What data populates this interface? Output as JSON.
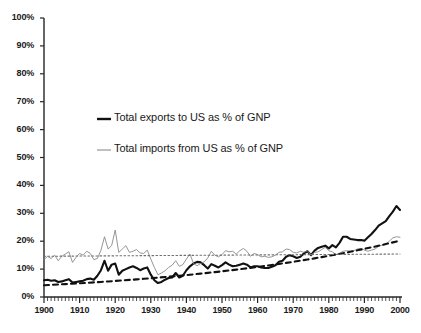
{
  "chart_data": {
    "type": "line",
    "title": "",
    "xlabel": "",
    "ylabel": "",
    "xlim": [
      1900,
      2000
    ],
    "ylim": [
      0,
      100
    ],
    "grid": false,
    "legend_position": "inside-upper-left",
    "y_ticks": [
      "0%",
      "10%",
      "20%",
      "30%",
      "40%",
      "50%",
      "60%",
      "70%",
      "80%",
      "90%",
      "100%"
    ],
    "y_tick_values": [
      0,
      10,
      20,
      30,
      40,
      50,
      60,
      70,
      80,
      90,
      100
    ],
    "x_ticks": [
      "1900",
      "1910",
      "1920",
      "1930",
      "1940",
      "1950",
      "1960",
      "1970",
      "1980",
      "1990",
      "2000"
    ],
    "x_tick_values": [
      1900,
      1910,
      1920,
      1930,
      1940,
      1950,
      1960,
      1970,
      1980,
      1990,
      2000
    ],
    "x_minor_tick_interval": 1,
    "series": [
      {
        "name": "Total exports to US as % of GNP",
        "style": "thick-solid",
        "color": "#111111",
        "x": [
          1900,
          1901,
          1902,
          1903,
          1904,
          1905,
          1906,
          1907,
          1908,
          1909,
          1910,
          1911,
          1912,
          1913,
          1914,
          1915,
          1916,
          1917,
          1918,
          1919,
          1920,
          1921,
          1922,
          1923,
          1924,
          1925,
          1926,
          1927,
          1928,
          1929,
          1930,
          1931,
          1932,
          1933,
          1934,
          1935,
          1936,
          1937,
          1938,
          1939,
          1940,
          1941,
          1942,
          1943,
          1944,
          1945,
          1946,
          1947,
          1948,
          1949,
          1950,
          1951,
          1952,
          1953,
          1954,
          1955,
          1956,
          1957,
          1958,
          1959,
          1960,
          1961,
          1962,
          1963,
          1964,
          1965,
          1966,
          1967,
          1968,
          1969,
          1970,
          1971,
          1972,
          1973,
          1974,
          1975,
          1976,
          1977,
          1978,
          1979,
          1980,
          1981,
          1982,
          1983,
          1984,
          1985,
          1986,
          1987,
          1988,
          1989,
          1990,
          1991,
          1992,
          1993,
          1994,
          1995,
          1996,
          1997,
          1998,
          1999,
          2000
        ],
        "values": [
          6.0,
          6.2,
          5.8,
          6.0,
          5.4,
          5.6,
          6.0,
          6.4,
          5.2,
          5.4,
          5.6,
          5.8,
          6.4,
          6.6,
          6.2,
          7.6,
          9.6,
          13.0,
          9.4,
          11.6,
          12.0,
          8.0,
          9.4,
          10.0,
          10.6,
          11.0,
          10.4,
          9.6,
          10.2,
          10.6,
          8.0,
          6.0,
          5.0,
          5.4,
          6.2,
          6.8,
          7.0,
          8.6,
          7.0,
          7.6,
          9.6,
          11.0,
          12.0,
          12.6,
          12.4,
          11.4,
          10.2,
          11.8,
          11.2,
          10.6,
          11.4,
          12.4,
          11.6,
          11.0,
          11.2,
          11.6,
          12.0,
          11.6,
          10.6,
          11.0,
          11.0,
          10.6,
          10.4,
          10.4,
          10.8,
          11.4,
          12.6,
          13.0,
          14.4,
          15.0,
          14.6,
          14.0,
          14.4,
          15.6,
          16.4,
          15.0,
          16.6,
          17.6,
          18.0,
          18.4,
          17.4,
          18.6,
          17.8,
          19.4,
          21.6,
          21.6,
          20.8,
          20.6,
          20.4,
          20.4,
          20.2,
          21.4,
          22.6,
          24.0,
          25.6,
          26.4,
          27.2,
          29.0,
          30.6,
          32.6,
          31.2
        ]
      },
      {
        "name": "Total imports from US as % of GNP",
        "style": "thin-solid",
        "color": "#8a8a8a",
        "x": [
          1900,
          1901,
          1902,
          1903,
          1904,
          1905,
          1906,
          1907,
          1908,
          1909,
          1910,
          1911,
          1912,
          1913,
          1914,
          1915,
          1916,
          1917,
          1918,
          1919,
          1920,
          1921,
          1922,
          1923,
          1924,
          1925,
          1926,
          1927,
          1928,
          1929,
          1930,
          1931,
          1932,
          1933,
          1934,
          1935,
          1936,
          1937,
          1938,
          1939,
          1940,
          1941,
          1942,
          1943,
          1944,
          1945,
          1946,
          1947,
          1948,
          1949,
          1950,
          1951,
          1952,
          1953,
          1954,
          1955,
          1956,
          1957,
          1958,
          1959,
          1960,
          1961,
          1962,
          1963,
          1964,
          1965,
          1966,
          1967,
          1968,
          1969,
          1970,
          1971,
          1972,
          1973,
          1974,
          1975,
          1976,
          1977,
          1978,
          1979,
          1980,
          1981,
          1982,
          1983,
          1984,
          1985,
          1986,
          1987,
          1988,
          1989,
          1990,
          1991,
          1992,
          1993,
          1994,
          1995,
          1996,
          1997,
          1998,
          1999,
          2000
        ],
        "values": [
          13.4,
          14.6,
          13.8,
          15.0,
          13.0,
          14.6,
          15.4,
          16.2,
          12.4,
          14.2,
          15.6,
          15.0,
          16.4,
          15.6,
          13.4,
          13.8,
          16.8,
          21.6,
          17.2,
          18.4,
          24.0,
          16.0,
          17.2,
          18.4,
          16.0,
          16.4,
          17.0,
          15.8,
          15.6,
          16.8,
          13.6,
          10.6,
          8.0,
          8.6,
          9.4,
          10.6,
          11.4,
          13.0,
          11.0,
          11.6,
          13.6,
          15.4,
          12.0,
          11.2,
          12.0,
          12.6,
          14.0,
          16.4,
          15.0,
          14.4,
          15.2,
          16.6,
          16.2,
          16.4,
          15.4,
          16.6,
          17.4,
          16.4,
          14.6,
          15.6,
          15.2,
          14.4,
          14.6,
          14.2,
          14.4,
          15.0,
          16.0,
          16.2,
          17.2,
          17.0,
          16.0,
          15.8,
          16.4,
          16.0,
          16.6,
          15.0,
          16.0,
          16.2,
          17.0,
          17.8,
          16.6,
          16.2,
          15.2,
          15.6,
          16.4,
          16.6,
          16.4,
          16.6,
          17.2,
          17.4,
          16.8,
          16.4,
          16.8,
          17.2,
          18.2,
          18.6,
          18.8,
          20.0,
          21.2,
          21.6,
          21.4
        ]
      },
      {
        "name": "exports-trend",
        "style": "dashed",
        "color": "#111111",
        "x": [
          1900,
          2000
        ],
        "values": [
          4.2,
          20.2
        ],
        "curve": "rising"
      },
      {
        "name": "imports-trend",
        "style": "dotted",
        "color": "#6f6f6f",
        "x": [
          1900,
          2000
        ],
        "values": [
          14.6,
          15.4
        ]
      }
    ]
  },
  "legend": {
    "items": [
      {
        "label": "Total exports to US as % of GNP",
        "color": "#111111",
        "style": "thick-solid"
      },
      {
        "label": "Total imports from US as % of GNP",
        "color": "#8a8a8a",
        "style": "thin-solid"
      }
    ]
  }
}
